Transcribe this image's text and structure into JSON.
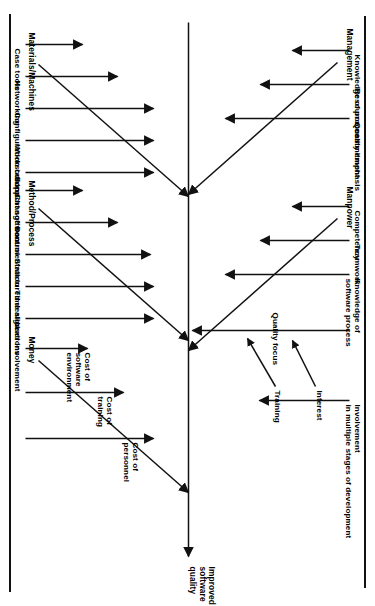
{
  "diagram": {
    "type": "fishbone-ishikawa",
    "orientation": "rotated-90-clockwise",
    "effect": "Improved software quality",
    "categories": [
      {
        "name": "Materials/Machines",
        "side": "top",
        "causes": [
          "Case tools",
          "Networking",
          "Configuration control",
          "Workstations",
          "Support software"
        ]
      },
      {
        "name": "Method/Process",
        "side": "top",
        "causes": [
          "Change control",
          "Documentation",
          "Structured design",
          "Time allocations",
          "User involvement"
        ]
      },
      {
        "name": "Management",
        "side": "bottom",
        "causes": [
          "Knowledge of process",
          "Resource commitment",
          "Quality emphasis"
        ]
      },
      {
        "name": "Manpower",
        "side": "bottom",
        "causes": [
          "Competency",
          "Teamwork",
          "Knowledge of software process",
          "Quality focus",
          "Involvement in multiple stages of development"
        ],
        "sub_causes": [
          {
            "label": "Interest",
            "feeds": "Quality focus"
          },
          {
            "label": "Training",
            "feeds": "Quality focus"
          }
        ]
      }
    ]
  },
  "labels": {
    "effect": "Improved software quality",
    "effect_l1": "Improved",
    "effect_l2": "software",
    "effect_l3": "quality",
    "cat_materials": "Materials/Machines",
    "cat_method": "Method/Process",
    "cat_money": "Money",
    "cat_management": "Management",
    "cat_manpower": "Manpower",
    "mat_1": "Case tools",
    "mat_2": "Networking",
    "mat_3": "Configuration control",
    "mat_4": "Workstations",
    "mat_5": "Support software",
    "met_1": "Change control",
    "met_2": "Documentation",
    "met_3": "Structured design",
    "met_4": "Time allocations",
    "met_5": "User involvement",
    "mon_1a": "Cost of",
    "mon_1b": "software",
    "mon_1c": "environment",
    "mon_2a": "Cost of",
    "mon_2b": "training",
    "mon_3a": "Cost of",
    "mon_3b": "personnel",
    "mgt_1": "Knowledge of process",
    "mgt_2": "Resource commitment",
    "mgt_3": "Quality emphasis",
    "mpw_1": "Competency",
    "mpw_2": "Teamwork",
    "mpw_3a": "Knowledge of",
    "mpw_3b": "software process",
    "mpw_4": "Quality focus",
    "mpw_5a": "Involvement",
    "mpw_5b": "in multiple stages of development",
    "mpw_sub_1": "Interest",
    "mpw_sub_2": "Training"
  },
  "colors": {
    "ink": "#111111",
    "paper": "#ffffff"
  }
}
